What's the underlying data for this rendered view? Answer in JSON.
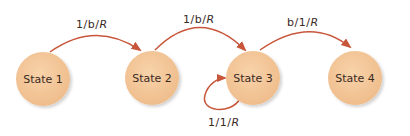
{
  "diagram": {
    "type": "state-machine",
    "colors": {
      "state_fill": "#f5c99a",
      "edge": "#c8563a",
      "text": "#3a2a1f"
    },
    "states": [
      {
        "id": "s1",
        "label": "State 1"
      },
      {
        "id": "s2",
        "label": "State 2"
      },
      {
        "id": "s3",
        "label": "State 3"
      },
      {
        "id": "s4",
        "label": "State 4"
      }
    ],
    "transitions": [
      {
        "from": "State 1",
        "to": "State 2",
        "label_a": "1/b/",
        "label_b": "R"
      },
      {
        "from": "State 2",
        "to": "State 3",
        "label_a": "1/b/",
        "label_b": "R"
      },
      {
        "from": "State 3",
        "to": "State 4",
        "label_a": "b/1/",
        "label_b": "R"
      },
      {
        "from": "State 3",
        "to": "State 3",
        "label_a": "1/1/",
        "label_b": "R"
      }
    ]
  }
}
